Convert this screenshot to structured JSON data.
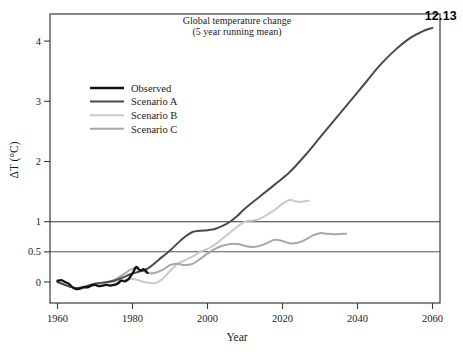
{
  "figure": {
    "number": "12.13"
  },
  "chart_data": {
    "type": "line",
    "title": "Global temperature change",
    "subtitle": "(5 year running mean)",
    "xlabel": "Year",
    "ylabel": "ΔT  (°C)",
    "xlim": [
      1958,
      2062
    ],
    "ylim": [
      -0.35,
      4.45
    ],
    "xticks": [
      1960,
      1980,
      2000,
      2020,
      2040,
      2060
    ],
    "xticklabels": [
      "1960",
      "1980",
      "2000",
      "2020",
      "2040",
      "2060"
    ],
    "yticks": [
      0,
      0.5,
      1,
      2,
      3,
      4
    ],
    "yticklabels": [
      "0",
      "0.5",
      "1",
      "2",
      "3",
      "4"
    ],
    "grid": false,
    "reference_lines": [
      {
        "y": 0.5,
        "color": "#555555"
      },
      {
        "y": 1.0,
        "color": "#333333"
      }
    ],
    "legend_position": "upper-left-inside",
    "series": [
      {
        "name": "Observed",
        "color": "#111111",
        "width": 2.3,
        "x": [
          1960,
          1961,
          1962,
          1963,
          1964,
          1965,
          1966,
          1967,
          1968,
          1969,
          1970,
          1971,
          1972,
          1973,
          1974,
          1975,
          1976,
          1977,
          1978,
          1979,
          1980,
          1981,
          1982,
          1983,
          1984
        ],
        "y": [
          0.02,
          0.03,
          0.0,
          -0.03,
          -0.09,
          -0.12,
          -0.11,
          -0.09,
          -0.09,
          -0.06,
          -0.05,
          -0.07,
          -0.06,
          -0.05,
          -0.06,
          -0.05,
          -0.03,
          0.02,
          0.01,
          0.05,
          0.14,
          0.25,
          0.19,
          0.21,
          0.15
        ]
      },
      {
        "name": "Scenario A",
        "color": "#4a4a4a",
        "width": 2.0,
        "x": [
          1960,
          1965,
          1970,
          1975,
          1980,
          1984,
          1988,
          1990,
          1992,
          1994,
          1996,
          1998,
          2000,
          2002,
          2004,
          2006,
          2008,
          2010,
          2014,
          2018,
          2022,
          2026,
          2030,
          2034,
          2038,
          2042,
          2046,
          2050,
          2054,
          2058,
          2060
        ],
        "y": [
          0.0,
          -0.1,
          -0.03,
          0.02,
          0.14,
          0.22,
          0.42,
          0.52,
          0.64,
          0.75,
          0.83,
          0.85,
          0.86,
          0.88,
          0.93,
          1.0,
          1.1,
          1.22,
          1.42,
          1.62,
          1.83,
          2.1,
          2.4,
          2.7,
          3.0,
          3.3,
          3.6,
          3.85,
          4.05,
          4.18,
          4.22
        ]
      },
      {
        "name": "Scenario B",
        "color": "#c9c9c9",
        "width": 2.0,
        "x": [
          1960,
          1965,
          1970,
          1975,
          1980,
          1983,
          1986,
          1988,
          1990,
          1992,
          1994,
          1996,
          1998,
          2000,
          2002,
          2004,
          2006,
          2008,
          2010,
          2012,
          2014,
          2016,
          2018,
          2020,
          2022,
          2024,
          2026,
          2027
        ],
        "y": [
          0.0,
          -0.1,
          -0.03,
          0.0,
          0.05,
          0.0,
          -0.02,
          0.05,
          0.18,
          0.3,
          0.36,
          0.42,
          0.5,
          0.55,
          0.62,
          0.72,
          0.82,
          0.92,
          1.0,
          1.02,
          1.05,
          1.12,
          1.2,
          1.3,
          1.36,
          1.33,
          1.34,
          1.35
        ]
      },
      {
        "name": "Scenario C",
        "color": "#a8a8a8",
        "width": 2.0,
        "x": [
          1960,
          1965,
          1970,
          1975,
          1980,
          1982,
          1985,
          1988,
          1990,
          1992,
          1994,
          1996,
          1998,
          2000,
          2002,
          2004,
          2006,
          2008,
          2010,
          2012,
          2014,
          2016,
          2018,
          2020,
          2022,
          2024,
          2026,
          2028,
          2030,
          2032,
          2034,
          2036,
          2037
        ],
        "y": [
          0.0,
          -0.1,
          -0.04,
          0.03,
          0.22,
          0.2,
          0.14,
          0.2,
          0.28,
          0.3,
          0.28,
          0.3,
          0.38,
          0.47,
          0.55,
          0.6,
          0.63,
          0.63,
          0.6,
          0.58,
          0.6,
          0.65,
          0.7,
          0.68,
          0.64,
          0.65,
          0.7,
          0.77,
          0.81,
          0.8,
          0.79,
          0.8,
          0.8
        ]
      }
    ]
  }
}
